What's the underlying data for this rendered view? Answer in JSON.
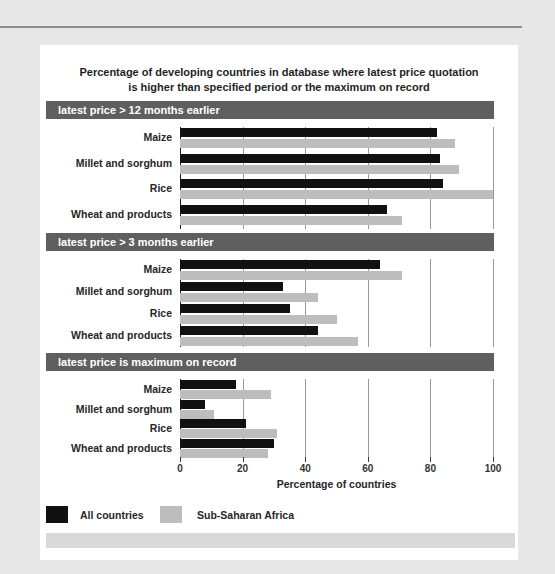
{
  "page": {
    "title_line1": "Percentage of developing countries in database where latest price quotation",
    "title_line2": "is higher than specified period or the maximum on record"
  },
  "colors": {
    "all_countries_bar": "#111111",
    "sub_saharan_bar": "#bdbdbd",
    "header_band": "#5f5f5f",
    "gridline": "#9a9a9a",
    "axis_line": "#1a1a1a",
    "footer_band": "#d9d9d9",
    "page_background": "#e7e7e7",
    "top_rule": "#8f8f8f"
  },
  "legend": [
    {
      "label": "All countries",
      "color": "#111111"
    },
    {
      "label": "Sub-Saharan Africa",
      "color": "#bdbdbd"
    }
  ],
  "chart_data": {
    "type": "bar",
    "orientation": "horizontal",
    "categories": [
      "Maize",
      "Millet and sorghum",
      "Rice",
      "Wheat and products"
    ],
    "xlabel": "Percentage of countries",
    "xlim": [
      0,
      100
    ],
    "xticks": [
      0,
      20,
      40,
      60,
      80,
      100
    ],
    "grid": "vertical",
    "legend_position": "bottom-left",
    "panels": [
      {
        "header": "latest price > 12 months earlier",
        "series": [
          {
            "name": "All countries",
            "values": [
              82,
              83,
              84,
              66
            ]
          },
          {
            "name": "Sub-Saharan Africa",
            "values": [
              88,
              89,
              100,
              71
            ]
          }
        ]
      },
      {
        "header": "latest price > 3 months earlier",
        "series": [
          {
            "name": "All countries",
            "values": [
              64,
              33,
              35,
              44
            ]
          },
          {
            "name": "Sub-Saharan Africa",
            "values": [
              71,
              44,
              50,
              57
            ]
          }
        ]
      },
      {
        "header": "latest price is maximum on record",
        "series": [
          {
            "name": "All countries",
            "values": [
              18,
              8,
              21,
              30
            ]
          },
          {
            "name": "Sub-Saharan Africa",
            "values": [
              29,
              11,
              31,
              28
            ]
          }
        ]
      }
    ]
  }
}
